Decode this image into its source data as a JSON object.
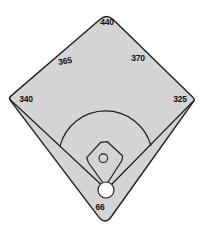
{
  "diagram": {
    "labels": {
      "center_field": "440",
      "left_center": "365",
      "right_center": "370",
      "left_line": "340",
      "right_line": "325",
      "backstop": "66"
    },
    "colors": {
      "background": "#ffffff",
      "field_fill": "#d4d4d4",
      "line": "#1f1f1f",
      "label_text": "#111111",
      "home_circle_fill": "#ffffff"
    }
  }
}
